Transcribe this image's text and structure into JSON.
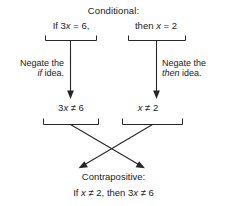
{
  "diagram": {
    "title_top": "Conditional:",
    "title_bottom": "Contrapositive:",
    "conditional": {
      "hypothesis": "If 3x = 6,",
      "conclusion": "then x = 2"
    },
    "operations": {
      "left_prefix": "Negate the",
      "left_target": "if",
      "left_suffix": "idea.",
      "right_prefix": "Negate the",
      "right_target": "then",
      "right_suffix": "idea."
    },
    "negations": {
      "left": "3x ≠ 6",
      "right": "x ≠ 2"
    },
    "contrapositive": "If x ≠ 2, then 3x ≠ 6",
    "colors": {
      "ink": "#262626",
      "text": "#1a1a1a",
      "background": "#ffffff"
    },
    "icon_names": {
      "down_arrow": "down-arrow-icon",
      "cross_arrows": "crossing-arrows-icon",
      "group_bracket": "group-bracket-icon"
    }
  }
}
